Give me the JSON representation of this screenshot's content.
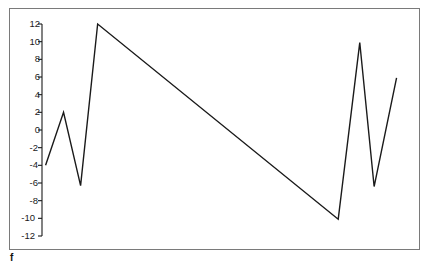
{
  "chart_data": {
    "type": "line",
    "title": "",
    "xlabel": "",
    "ylabel": "",
    "corner_label": "f",
    "grid": false,
    "legend": false,
    "line_color": "#1a1a1a",
    "frame_color": "#7a7a7a",
    "background": "#ffffff",
    "xlim": [
      0,
      42
    ],
    "ylim": [
      -12.8,
      12.8
    ],
    "yticks": [
      12,
      10,
      8,
      6,
      4,
      2,
      0,
      -2,
      -4,
      -6,
      -8,
      -10,
      -12
    ],
    "ytick_labels": [
      "12",
      "10",
      "8",
      "6",
      "4",
      "2",
      "0",
      "-2",
      "-4",
      "-6",
      "-8",
      "-10",
      "-12"
    ],
    "xticks": [],
    "xtick_labels": [],
    "series": [
      {
        "name": "f",
        "x": [
          0.4,
          2.4,
          4.3,
          6.2,
          33.0,
          35.4,
          37.0,
          39.5
        ],
        "values": [
          -4.0,
          2.0,
          -6.3,
          12.0,
          -10.1,
          9.9,
          -6.4,
          5.9
        ]
      }
    ]
  },
  "axis": {
    "spine_color": "#1a1a1a",
    "tick_length": 4
  }
}
